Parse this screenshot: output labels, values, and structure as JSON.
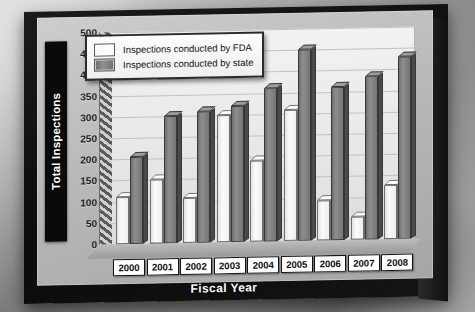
{
  "chart_data": {
    "type": "bar",
    "title": "",
    "xlabel": "Fiscal Year",
    "ylabel": "Total Inspections",
    "categories": [
      "2000",
      "2001",
      "2002",
      "2003",
      "2004",
      "2005",
      "2006",
      "2007",
      "2008"
    ],
    "series": [
      {
        "name": "Inspections conducted by FDA",
        "color": "#fbfbfb",
        "values": [
          110,
          150,
          105,
          300,
          190,
          310,
          95,
          55,
          128
        ]
      },
      {
        "name": "Inspections conducted by state",
        "color": "#7a7a7a",
        "values": [
          205,
          300,
          310,
          320,
          360,
          450,
          360,
          385,
          430
        ]
      }
    ],
    "ylim": [
      0,
      500
    ],
    "yticks": [
      0,
      50,
      100,
      150,
      200,
      250,
      300,
      350,
      400,
      450,
      500
    ],
    "ytick_labels": [
      "0",
      "50",
      "100",
      "150",
      "200",
      "250",
      "300",
      "350",
      "400",
      "450",
      "500"
    ],
    "grid": true,
    "legend_position": "top-left",
    "style": "3d-bar"
  },
  "legend": {
    "entries": [
      {
        "label": "Inspections conducted by FDA"
      },
      {
        "label": "Inspections conducted by state"
      }
    ]
  },
  "axes": {
    "y_title": "Total Inspections",
    "x_title": "Fiscal Year"
  },
  "colors": {
    "fda_bar": "#fbfbfb",
    "state_bar": "#7a7a7a",
    "frame": "#111111",
    "plot_bg": "#eeeeee"
  }
}
